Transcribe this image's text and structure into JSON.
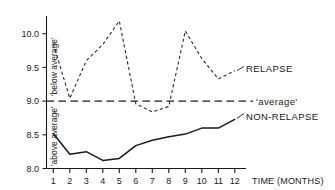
{
  "chart_data": {
    "type": "line",
    "title": "",
    "xlabel": "TIME (MONTHS)",
    "ylabel": "",
    "x": [
      1,
      2,
      3,
      4,
      5,
      6,
      7,
      8,
      9,
      10,
      11,
      12
    ],
    "categories": [
      "1",
      "2",
      "3",
      "4",
      "5",
      "6",
      "7",
      "8",
      "9",
      "10",
      "11",
      "12"
    ],
    "xlim": [
      0.5,
      12.6
    ],
    "ylim": [
      8.0,
      10.3
    ],
    "yticks": [
      "8.0",
      "8.5",
      "9.0",
      "9.5",
      "10.0"
    ],
    "ytick_values": [
      8.0,
      8.5,
      9.0,
      9.5,
      10.0
    ],
    "grid": false,
    "legend_position": "right-inline",
    "series": [
      {
        "name": "RELAPSE",
        "style": "dashed",
        "color": "#2b2b2b",
        "values": [
          9.85,
          9.04,
          9.6,
          9.84,
          10.19,
          8.96,
          8.84,
          8.92,
          10.04,
          9.63,
          9.33,
          9.45
        ]
      },
      {
        "name": "'average'",
        "style": "long-dashed",
        "color": "#1a1a1a",
        "values": [
          9.0,
          9.0,
          9.0,
          9.0,
          9.0,
          9.0,
          9.0,
          9.0,
          9.0,
          9.0,
          9.0,
          9.0
        ]
      },
      {
        "name": "NON-RELAPSE",
        "style": "solid",
        "color": "#1a1a1a",
        "values": [
          8.52,
          8.21,
          8.25,
          8.12,
          8.15,
          8.34,
          8.42,
          8.47,
          8.51,
          8.6,
          8.6,
          8.73
        ]
      }
    ],
    "annotations": [
      {
        "text": "'below average'",
        "orientation": "vertical",
        "region": "above-average-line"
      },
      {
        "text": "'above average'",
        "orientation": "vertical",
        "region": "below-average-line"
      }
    ]
  },
  "axis": {
    "x_title": "TIME (MONTHS)",
    "y_region_upper": "'below average'",
    "y_region_lower": "'above average'"
  },
  "labels": {
    "relapse": "RELAPSE",
    "average": "'average'",
    "non_relapse": "NON-RELAPSE"
  },
  "yticks": {
    "t0": "8.0",
    "t1": "8.5",
    "t2": "9.0",
    "t3": "9.5",
    "t4": "10.0"
  },
  "xticks": {
    "m1": "1",
    "m2": "2",
    "m3": "3",
    "m4": "4",
    "m5": "5",
    "m6": "6",
    "m7": "7",
    "m8": "8",
    "m9": "9",
    "m10": "10",
    "m11": "11",
    "m12": "12"
  }
}
